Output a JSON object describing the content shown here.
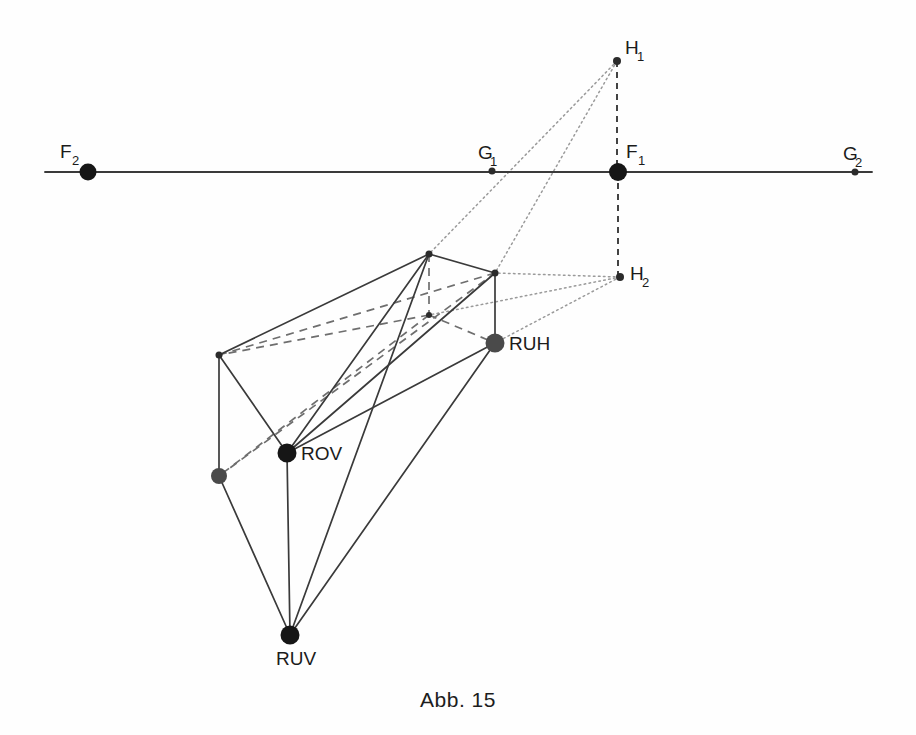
{
  "figure": {
    "caption": "Abb. 15",
    "kind": "perspective-construction-diagram",
    "canvas": {
      "width": 916,
      "height": 735
    },
    "colors": {
      "solid_line": "#3a3a3a",
      "hidden_line": "#6e6e6e",
      "ray_line": "#9a9a9a",
      "axis_line": "#3a3a3a",
      "label_text": "#1b1b1b",
      "major_point": "#161616",
      "minor_point": "#2b2b2b",
      "gray_point": "#4a4a4a",
      "background": "#fefefe"
    },
    "horizon": {
      "name": "horizon-line",
      "x1": 45,
      "x2": 872,
      "y": 172
    },
    "points": [
      {
        "id": "F2",
        "label": "F",
        "sub": "2",
        "x": 88,
        "y": 172,
        "r": 8.5,
        "style": "major",
        "label_dx": -28,
        "label_dy": -14
      },
      {
        "id": "G1",
        "label": "G",
        "sub": "1",
        "x": 492,
        "y": 171,
        "r": 3.5,
        "style": "minor",
        "label_dx": -14,
        "label_dy": -12
      },
      {
        "id": "F1",
        "label": "F",
        "sub": "1",
        "x": 618,
        "y": 172,
        "r": 9.0,
        "style": "major",
        "label_dx": 8,
        "label_dy": -14
      },
      {
        "id": "G2",
        "label": "G",
        "sub": "2",
        "x": 855,
        "y": 172,
        "r": 3.5,
        "style": "minor",
        "label_dx": -12,
        "label_dy": -12
      },
      {
        "id": "H1",
        "label": "H",
        "sub": "1",
        "x": 617,
        "y": 61,
        "r": 4.0,
        "style": "minor",
        "label_dx": 8,
        "label_dy": -7
      },
      {
        "id": "H2",
        "label": "H",
        "sub": "2",
        "x": 620,
        "y": 277,
        "r": 4.0,
        "style": "minor",
        "label_dx": 10,
        "label_dy": 3
      },
      {
        "id": "TL",
        "label": "",
        "sub": "",
        "x": 219,
        "y": 355,
        "r": 3.5,
        "style": "minor",
        "label_dx": 0,
        "label_dy": 0
      },
      {
        "id": "TA",
        "label": "",
        "sub": "",
        "x": 429,
        "y": 254,
        "r": 3.5,
        "style": "minor",
        "label_dx": 0,
        "label_dy": 0
      },
      {
        "id": "TR",
        "label": "",
        "sub": "",
        "x": 495,
        "y": 273,
        "r": 3.5,
        "style": "minor",
        "label_dx": 0,
        "label_dy": 0
      },
      {
        "id": "HID",
        "label": "",
        "sub": "",
        "x": 429,
        "y": 315,
        "r": 3.0,
        "style": "minor",
        "label_dx": 0,
        "label_dy": 0
      },
      {
        "id": "RUH",
        "label": "RUH",
        "sub": "",
        "x": 495,
        "y": 343,
        "r": 9.5,
        "style": "gray",
        "label_dx": 14,
        "label_dy": 7
      },
      {
        "id": "ROV",
        "label": "ROV",
        "sub": "",
        "x": 287,
        "y": 453,
        "r": 9.5,
        "style": "major",
        "label_dx": 14,
        "label_dy": 7
      },
      {
        "id": "GLB",
        "label": "",
        "sub": "",
        "x": 219,
        "y": 476,
        "r": 8.0,
        "style": "gray",
        "label_dx": 0,
        "label_dy": 0
      },
      {
        "id": "RUV",
        "label": "RUV",
        "sub": "",
        "x": 290,
        "y": 635,
        "r": 9.5,
        "style": "major",
        "label_dx": -14,
        "label_dy": 30
      }
    ],
    "edges_solid": [
      {
        "from": "TL",
        "to": "TA"
      },
      {
        "from": "TA",
        "to": "TR"
      },
      {
        "from": "TL",
        "to": "ROV"
      },
      {
        "from": "TL",
        "to": "GLB"
      },
      {
        "from": "TR",
        "to": "RUH"
      },
      {
        "from": "ROV",
        "to": "TA"
      },
      {
        "from": "ROV",
        "to": "TR"
      },
      {
        "from": "ROV",
        "to": "RUH"
      },
      {
        "from": "ROV",
        "to": "RUV"
      },
      {
        "from": "GLB",
        "to": "RUV"
      },
      {
        "from": "RUV",
        "to": "TA"
      },
      {
        "from": "RUV",
        "to": "RUH"
      }
    ],
    "edges_hidden": [
      {
        "from": "TA",
        "to": "HID"
      },
      {
        "from": "HID",
        "to": "TL"
      },
      {
        "from": "HID",
        "to": "RUH"
      },
      {
        "from": "HID",
        "to": "GLB"
      },
      {
        "from": "TL",
        "to": "TR"
      },
      {
        "from": "GLB",
        "to": "TR"
      }
    ],
    "rays_dotted": [
      {
        "from": "H1",
        "to": "TA"
      },
      {
        "from": "H1",
        "to": "TR"
      },
      {
        "from": "H2",
        "to": "TR"
      },
      {
        "from": "H2",
        "to": "RUH"
      },
      {
        "from": "H2",
        "to": "HID"
      }
    ],
    "dashed_verticals": [
      {
        "name": "F1-H1-vertical",
        "x": 617,
        "y1": 61,
        "y2": 172
      },
      {
        "name": "F1-H2-vertical",
        "x": 618,
        "y1": 172,
        "y2": 277
      }
    ]
  }
}
